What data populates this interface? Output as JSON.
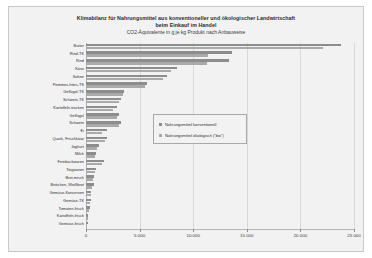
{
  "chart_data": {
    "type": "bar",
    "orientation": "horizontal",
    "title": "Klimabilanz für Nahrungsmittel aus konventioneller und ökologischer Landwirtschaft",
    "title_line2": "beim Einkauf im Handel",
    "subtitle": "CO2-Äquivalente in g je kg Produkt nach Anbauweise",
    "xlabel": "",
    "ylabel": "",
    "xlim": [
      0,
      25000
    ],
    "grid": true,
    "legend_position": "center",
    "tick_labels": [
      "0",
      "5.000",
      "10.000",
      "15.000",
      "20.000",
      "25.000"
    ],
    "tick_values": [
      0,
      5000,
      10000,
      15000,
      20000,
      25000
    ],
    "categories": [
      "Butter",
      "Rind-TK",
      "Rind",
      "Käse",
      "Sahne",
      "Pommes-frites-TK",
      "Geflügel-TK",
      "Schwein-TK",
      "Kartoffeln-trocken",
      "Geflügel",
      "Schwein",
      "Ei",
      "Quark, Frischkäse",
      "Joghurt",
      "Milch",
      "Feinbackwaren",
      "Teigwaren",
      "Brot-misch",
      "Brötchen, Weißbrot",
      "Gemüse-Konserven",
      "Gemüse-TK",
      "Tomaten-frisch",
      "Kartoffeln-frisch",
      "Gemüse-frisch"
    ],
    "series": [
      {
        "name": "Nahrungsmittel konventionell",
        "color": "#8d8d8d",
        "values": [
          23800,
          13600,
          13300,
          8500,
          7600,
          5700,
          3500,
          3250,
          2900,
          3100,
          3250,
          1930,
          1950,
          1250,
          940,
          1700,
          900,
          750,
          700,
          510,
          420,
          340,
          200,
          150
        ]
      },
      {
        "name": "Nahrungsmittel ökologisch (\"bio\")",
        "color": "#a9a9a9",
        "values": [
          22100,
          11400,
          11300,
          7900,
          7200,
          5550,
          3450,
          3100,
          2500,
          2850,
          3050,
          1500,
          1750,
          1050,
          880,
          1450,
          800,
          650,
          600,
          450,
          380,
          310,
          170,
          130
        ]
      }
    ]
  },
  "legend": {
    "entries": [
      {
        "label": "Nahrungsmittel konventionell"
      },
      {
        "label": "Nahrungsmittel ökologisch (\"bio\")"
      }
    ]
  }
}
